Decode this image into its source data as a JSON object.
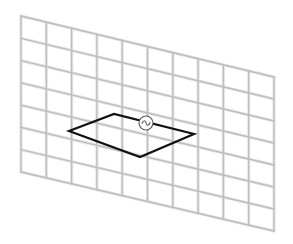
{
  "diagram": {
    "title": "",
    "colors": {
      "background": "#ffffff",
      "grid_stroke": "#bdbdbd",
      "grid_highlight": "#e6e6e6",
      "coil_stroke": "#111111",
      "source_stroke": "#555555"
    },
    "grid": {
      "columns": 10,
      "rows": 7,
      "corners": {
        "top_left": [
          21,
          16
        ],
        "bottom_left": [
          21,
          172
        ],
        "top_right": [
          274,
          77
        ],
        "bottom_right": [
          274,
          231
        ]
      }
    },
    "coil": {
      "shape": "parallelogram",
      "points": [
        [
          69,
          131
        ],
        [
          114,
          114
        ],
        [
          194,
          134
        ],
        [
          140,
          157
        ]
      ]
    },
    "source": {
      "symbol": "ac-source",
      "glyph": "~",
      "center": [
        146,
        123
      ],
      "radius": 7
    }
  }
}
